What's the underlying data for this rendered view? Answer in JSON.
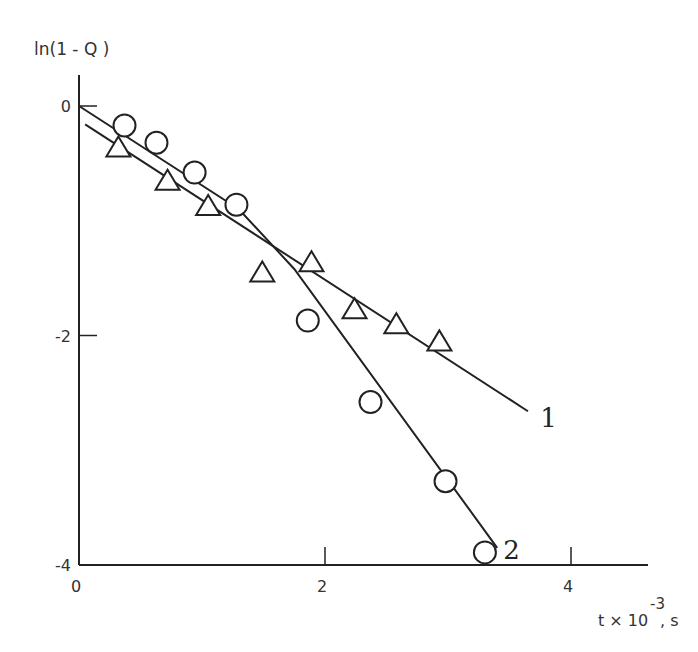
{
  "chart_data": {
    "type": "scatter",
    "title": "",
    "xlabel": "t × 10^-3, s",
    "xlabel_main": "t × 10",
    "xlabel_exp": "-3",
    "xlabel_unit": ", s",
    "ylabel": "ln(1 - Q )",
    "xlim": [
      0,
      4.6
    ],
    "ylim": [
      -4,
      0.3
    ],
    "xticks": [
      0,
      2,
      4
    ],
    "yticks": [
      0,
      -2,
      -4
    ],
    "xtick_labels": [
      "0",
      "2",
      "4"
    ],
    "ytick_labels": [
      "0",
      "-2",
      "-4"
    ],
    "grid": false,
    "legend": "inline curve labels",
    "series": [
      {
        "name": "1",
        "marker": "triangle",
        "points": [
          {
            "x": 0.32,
            "y": -0.37
          },
          {
            "x": 0.72,
            "y": -0.66
          },
          {
            "x": 1.05,
            "y": -0.88
          },
          {
            "x": 1.49,
            "y": -1.46
          },
          {
            "x": 1.89,
            "y": -1.37
          },
          {
            "x": 2.24,
            "y": -1.78
          },
          {
            "x": 2.58,
            "y": -1.91
          },
          {
            "x": 2.93,
            "y": -2.06
          }
        ],
        "fit_line": [
          {
            "x": 0.05,
            "y": -0.16
          },
          {
            "x": 3.65,
            "y": -2.66
          }
        ]
      },
      {
        "name": "2",
        "marker": "circle",
        "points": [
          {
            "x": 0.37,
            "y": -0.17
          },
          {
            "x": 0.63,
            "y": -0.32
          },
          {
            "x": 0.94,
            "y": -0.58
          },
          {
            "x": 1.28,
            "y": -0.86
          },
          {
            "x": 1.86,
            "y": -1.87
          },
          {
            "x": 2.37,
            "y": -2.58
          },
          {
            "x": 2.98,
            "y": -3.27
          },
          {
            "x": 3.3,
            "y": -3.89
          }
        ],
        "fit_line": [
          {
            "x": 0.0,
            "y": 0.0
          },
          {
            "x": 1.3,
            "y": -0.9
          },
          {
            "x": 1.75,
            "y": -1.42
          },
          {
            "x": 3.4,
            "y": -3.85
          }
        ]
      }
    ],
    "annotations": [
      {
        "text": "1",
        "x": 3.75,
        "y": -2.72
      },
      {
        "text": "2",
        "x": 3.45,
        "y": -3.87
      }
    ]
  }
}
